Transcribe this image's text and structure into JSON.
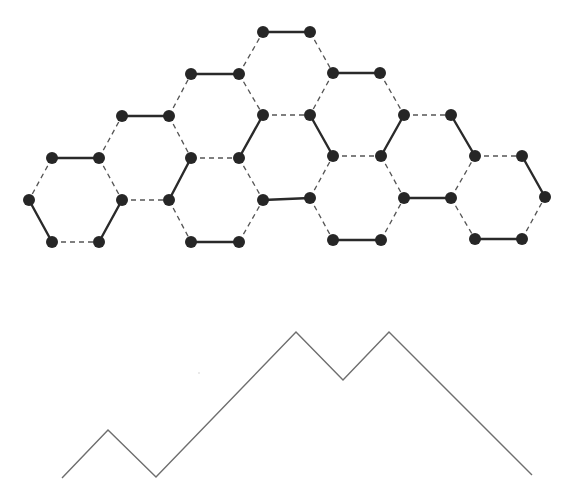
{
  "diagram": {
    "type": "kekule-structure-and-lattice-path",
    "colors": {
      "background": "#ffffff",
      "atom": "#262626",
      "double_bond": "#2a2a2a",
      "single_bond": "#555555",
      "path": "#6e6e6e"
    },
    "atom_radius": 6,
    "atoms": [
      [
        263,
        32
      ],
      [
        310,
        32
      ],
      [
        191,
        74
      ],
      [
        239,
        74
      ],
      [
        333,
        73
      ],
      [
        380,
        73
      ],
      [
        122,
        116
      ],
      [
        169,
        116
      ],
      [
        263,
        115
      ],
      [
        310,
        115
      ],
      [
        404,
        115
      ],
      [
        451,
        115
      ],
      [
        52,
        158
      ],
      [
        99,
        158
      ],
      [
        191,
        158
      ],
      [
        239,
        158
      ],
      [
        333,
        156
      ],
      [
        381,
        156
      ],
      [
        475,
        156
      ],
      [
        522,
        156
      ],
      [
        29,
        200
      ],
      [
        122,
        200
      ],
      [
        169,
        200
      ],
      [
        263,
        200
      ],
      [
        310,
        198
      ],
      [
        404,
        198
      ],
      [
        451,
        198
      ],
      [
        545,
        197
      ],
      [
        52,
        242
      ],
      [
        99,
        242
      ],
      [
        191,
        242
      ],
      [
        239,
        242
      ],
      [
        333,
        240
      ],
      [
        381,
        240
      ],
      [
        475,
        239
      ],
      [
        522,
        239
      ]
    ],
    "double_bonds": [
      [
        [
          263,
          32
        ],
        [
          310,
          32
        ]
      ],
      [
        [
          191,
          74
        ],
        [
          239,
          74
        ]
      ],
      [
        [
          333,
          73
        ],
        [
          380,
          73
        ]
      ],
      [
        [
          122,
          116
        ],
        [
          169,
          116
        ]
      ],
      [
        [
          263,
          115
        ],
        [
          239,
          158
        ]
      ],
      [
        [
          310,
          115
        ],
        [
          333,
          156
        ]
      ],
      [
        [
          404,
          115
        ],
        [
          381,
          156
        ]
      ],
      [
        [
          451,
          115
        ],
        [
          475,
          156
        ]
      ],
      [
        [
          52,
          158
        ],
        [
          99,
          158
        ]
      ],
      [
        [
          191,
          158
        ],
        [
          169,
          200
        ]
      ],
      [
        [
          522,
          156
        ],
        [
          545,
          197
        ]
      ],
      [
        [
          29,
          200
        ],
        [
          52,
          242
        ]
      ],
      [
        [
          122,
          200
        ],
        [
          99,
          242
        ]
      ],
      [
        [
          263,
          200
        ],
        [
          310,
          198
        ]
      ],
      [
        [
          404,
          198
        ],
        [
          451,
          198
        ]
      ],
      [
        [
          191,
          242
        ],
        [
          239,
          242
        ]
      ],
      [
        [
          333,
          240
        ],
        [
          381,
          240
        ]
      ],
      [
        [
          475,
          239
        ],
        [
          522,
          239
        ]
      ]
    ],
    "single_bonds": [
      [
        [
          239,
          74
        ],
        [
          263,
          32
        ]
      ],
      [
        [
          310,
          32
        ],
        [
          333,
          73
        ]
      ],
      [
        [
          169,
          116
        ],
        [
          191,
          74
        ]
      ],
      [
        [
          239,
          74
        ],
        [
          263,
          115
        ]
      ],
      [
        [
          333,
          73
        ],
        [
          310,
          115
        ]
      ],
      [
        [
          380,
          73
        ],
        [
          404,
          115
        ]
      ],
      [
        [
          99,
          158
        ],
        [
          122,
          116
        ]
      ],
      [
        [
          169,
          116
        ],
        [
          191,
          158
        ]
      ],
      [
        [
          263,
          115
        ],
        [
          310,
          115
        ]
      ],
      [
        [
          404,
          115
        ],
        [
          451,
          115
        ]
      ],
      [
        [
          191,
          158
        ],
        [
          239,
          158
        ]
      ],
      [
        [
          333,
          156
        ],
        [
          381,
          156
        ]
      ],
      [
        [
          475,
          156
        ],
        [
          522,
          156
        ]
      ],
      [
        [
          52,
          158
        ],
        [
          29,
          200
        ]
      ],
      [
        [
          99,
          158
        ],
        [
          122,
          200
        ]
      ],
      [
        [
          122,
          200
        ],
        [
          169,
          200
        ]
      ],
      [
        [
          239,
          158
        ],
        [
          263,
          200
        ]
      ],
      [
        [
          310,
          198
        ],
        [
          333,
          156
        ]
      ],
      [
        [
          381,
          156
        ],
        [
          404,
          198
        ]
      ],
      [
        [
          451,
          198
        ],
        [
          475,
          156
        ]
      ],
      [
        [
          52,
          242
        ],
        [
          99,
          242
        ]
      ],
      [
        [
          169,
          200
        ],
        [
          191,
          242
        ]
      ],
      [
        [
          239,
          242
        ],
        [
          263,
          200
        ]
      ],
      [
        [
          310,
          198
        ],
        [
          333,
          240
        ]
      ],
      [
        [
          381,
          240
        ],
        [
          404,
          198
        ]
      ],
      [
        [
          451,
          198
        ],
        [
          475,
          239
        ]
      ],
      [
        [
          522,
          239
        ],
        [
          545,
          197
        ]
      ]
    ],
    "mountain_path": {
      "points": [
        [
          62,
          478
        ],
        [
          108,
          430
        ],
        [
          156,
          477
        ],
        [
          296,
          332
        ],
        [
          343,
          380
        ],
        [
          389,
          332
        ],
        [
          532,
          475
        ]
      ],
      "steps": [
        "up",
        "down",
        "up",
        "up",
        "up",
        "down",
        "up",
        "down",
        "down",
        "down"
      ]
    },
    "speck": [
      199,
      373
    ]
  }
}
